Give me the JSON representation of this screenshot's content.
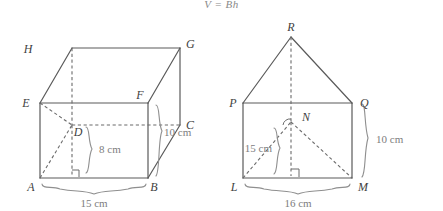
{
  "figure": {
    "formula": "V = Bh",
    "background_color": "#ffffff",
    "line_color": "#5a5a5a",
    "label_color": "#3f3f3f",
    "dimension_color": "#7d7d7d"
  },
  "left_figure": {
    "name": "rectangular-prism",
    "vertices": [
      {
        "label": "H",
        "x": 72,
        "y": 48
      },
      {
        "label": "G",
        "x": 180,
        "y": 48
      },
      {
        "label": "E",
        "x": 40,
        "y": 103
      },
      {
        "label": "F",
        "x": 148,
        "y": 103
      },
      {
        "label": "D",
        "x": 72,
        "y": 125
      },
      {
        "label": "C",
        "x": 180,
        "y": 125
      },
      {
        "label": "A",
        "x": 40,
        "y": 178
      },
      {
        "label": "B",
        "x": 148,
        "y": 178
      }
    ],
    "dimensions": [
      {
        "label": "8 cm",
        "measures": "height-of-triangle-face"
      },
      {
        "label": "10 cm",
        "measures": "depth-edge-BC"
      },
      {
        "label": "15 cm",
        "measures": "base-edge-AB"
      }
    ]
  },
  "right_figure": {
    "name": "triangular-prism",
    "vertices": [
      {
        "label": "R",
        "x": 291,
        "y": 37
      },
      {
        "label": "P",
        "x": 243,
        "y": 103
      },
      {
        "label": "Q",
        "x": 352,
        "y": 103
      },
      {
        "label": "N",
        "x": 291,
        "y": 122
      },
      {
        "label": "L",
        "x": 243,
        "y": 178
      },
      {
        "label": "M",
        "x": 352,
        "y": 178
      }
    ],
    "dimensions": [
      {
        "label": "15 cm",
        "measures": "slant-edge-LN"
      },
      {
        "label": "10 cm",
        "measures": "height-edge-QM"
      },
      {
        "label": "16 cm",
        "measures": "base-edge-LM"
      }
    ]
  },
  "labels": {
    "H": "H",
    "G": "G",
    "E": "E",
    "F": "F",
    "D": "D",
    "C": "C",
    "A": "A",
    "B": "B",
    "R": "R",
    "P": "P",
    "Q": "Q",
    "N": "N",
    "L": "L",
    "M": "M",
    "dim_8cm": "8 cm",
    "dim_10cm_left": "10 cm",
    "dim_15cm_left": "15 cm",
    "dim_15cm_right": "15 cm",
    "dim_10cm_right": "10 cm",
    "dim_16cm_right": "16 cm"
  }
}
